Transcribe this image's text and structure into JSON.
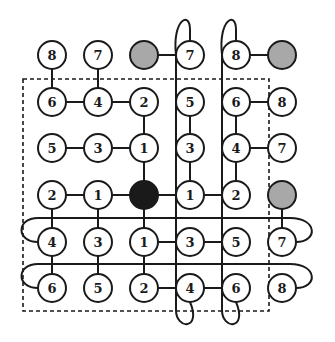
{
  "diagram": {
    "title": "",
    "grid": {
      "cols": 6,
      "rows": 6,
      "col_x": [
        52,
        98,
        144,
        190,
        236,
        282
      ],
      "row_y": [
        55,
        102,
        148,
        195,
        242,
        288
      ],
      "node_radius": 14
    },
    "colors": {
      "stroke": "#1a1a1a",
      "node_fill": "#ffffff",
      "gray_fill": "#a8a8a8",
      "black_fill": "#1a1a1a",
      "background": "#ffffff"
    },
    "nodes": [
      {
        "r": 0,
        "c": 0,
        "label": "8",
        "type": "normal"
      },
      {
        "r": 0,
        "c": 1,
        "label": "7",
        "type": "normal"
      },
      {
        "r": 0,
        "c": 2,
        "label": "",
        "type": "gray"
      },
      {
        "r": 0,
        "c": 3,
        "label": "7",
        "type": "normal"
      },
      {
        "r": 0,
        "c": 4,
        "label": "8",
        "type": "normal"
      },
      {
        "r": 0,
        "c": 5,
        "label": "",
        "type": "gray"
      },
      {
        "r": 1,
        "c": 0,
        "label": "6",
        "type": "normal"
      },
      {
        "r": 1,
        "c": 1,
        "label": "4",
        "type": "normal"
      },
      {
        "r": 1,
        "c": 2,
        "label": "2",
        "type": "normal"
      },
      {
        "r": 1,
        "c": 3,
        "label": "5",
        "type": "normal"
      },
      {
        "r": 1,
        "c": 4,
        "label": "6",
        "type": "normal"
      },
      {
        "r": 1,
        "c": 5,
        "label": "8",
        "type": "normal"
      },
      {
        "r": 2,
        "c": 0,
        "label": "5",
        "type": "normal"
      },
      {
        "r": 2,
        "c": 1,
        "label": "3",
        "type": "normal"
      },
      {
        "r": 2,
        "c": 2,
        "label": "1",
        "type": "normal"
      },
      {
        "r": 2,
        "c": 3,
        "label": "3",
        "type": "normal"
      },
      {
        "r": 2,
        "c": 4,
        "label": "4",
        "type": "normal"
      },
      {
        "r": 2,
        "c": 5,
        "label": "7",
        "type": "normal"
      },
      {
        "r": 3,
        "c": 0,
        "label": "2",
        "type": "normal"
      },
      {
        "r": 3,
        "c": 1,
        "label": "1",
        "type": "normal"
      },
      {
        "r": 3,
        "c": 2,
        "label": "",
        "type": "black"
      },
      {
        "r": 3,
        "c": 3,
        "label": "1",
        "type": "normal"
      },
      {
        "r": 3,
        "c": 4,
        "label": "2",
        "type": "normal"
      },
      {
        "r": 3,
        "c": 5,
        "label": "",
        "type": "gray"
      },
      {
        "r": 4,
        "c": 0,
        "label": "4",
        "type": "normal"
      },
      {
        "r": 4,
        "c": 1,
        "label": "3",
        "type": "normal"
      },
      {
        "r": 4,
        "c": 2,
        "label": "1",
        "type": "normal"
      },
      {
        "r": 4,
        "c": 3,
        "label": "3",
        "type": "normal"
      },
      {
        "r": 4,
        "c": 4,
        "label": "5",
        "type": "normal"
      },
      {
        "r": 4,
        "c": 5,
        "label": "7",
        "type": "normal"
      },
      {
        "r": 5,
        "c": 0,
        "label": "6",
        "type": "normal"
      },
      {
        "r": 5,
        "c": 1,
        "label": "5",
        "type": "normal"
      },
      {
        "r": 5,
        "c": 2,
        "label": "2",
        "type": "normal"
      },
      {
        "r": 5,
        "c": 3,
        "label": "4",
        "type": "normal"
      },
      {
        "r": 5,
        "c": 4,
        "label": "6",
        "type": "normal"
      },
      {
        "r": 5,
        "c": 5,
        "label": "8",
        "type": "normal"
      }
    ],
    "edges": [
      [
        [
          0,
          0
        ],
        [
          1,
          0
        ]
      ],
      [
        [
          0,
          1
        ],
        [
          1,
          1
        ]
      ],
      [
        [
          0,
          2
        ],
        [
          0,
          3
        ]
      ],
      [
        [
          0,
          4
        ],
        [
          0,
          5
        ]
      ],
      [
        [
          1,
          0
        ],
        [
          1,
          1
        ]
      ],
      [
        [
          1,
          1
        ],
        [
          1,
          2
        ]
      ],
      [
        [
          1,
          4
        ],
        [
          1,
          5
        ]
      ],
      [
        [
          1,
          2
        ],
        [
          2,
          2
        ]
      ],
      [
        [
          1,
          3
        ],
        [
          2,
          3
        ]
      ],
      [
        [
          1,
          4
        ],
        [
          2,
          4
        ]
      ],
      [
        [
          2,
          0
        ],
        [
          2,
          1
        ]
      ],
      [
        [
          2,
          1
        ],
        [
          2,
          2
        ]
      ],
      [
        [
          2,
          4
        ],
        [
          2,
          5
        ]
      ],
      [
        [
          2,
          2
        ],
        [
          3,
          2
        ]
      ],
      [
        [
          2,
          3
        ],
        [
          3,
          3
        ]
      ],
      [
        [
          2,
          4
        ],
        [
          3,
          4
        ]
      ],
      [
        [
          3,
          0
        ],
        [
          3,
          1
        ]
      ],
      [
        [
          3,
          1
        ],
        [
          3,
          2
        ]
      ],
      [
        [
          3,
          2
        ],
        [
          3,
          3
        ]
      ],
      [
        [
          3,
          3
        ],
        [
          3,
          4
        ]
      ],
      [
        [
          3,
          0
        ],
        [
          4,
          0
        ]
      ],
      [
        [
          3,
          1
        ],
        [
          4,
          1
        ]
      ],
      [
        [
          3,
          2
        ],
        [
          4,
          2
        ]
      ],
      [
        [
          3,
          5
        ],
        [
          4,
          5
        ]
      ],
      [
        [
          4,
          2
        ],
        [
          4,
          3
        ]
      ],
      [
        [
          4,
          3
        ],
        [
          4,
          4
        ]
      ],
      [
        [
          4,
          0
        ],
        [
          5,
          0
        ]
      ],
      [
        [
          4,
          1
        ],
        [
          5,
          1
        ]
      ],
      [
        [
          4,
          2
        ],
        [
          5,
          2
        ]
      ],
      [
        [
          5,
          2
        ],
        [
          5,
          3
        ]
      ],
      [
        [
          5,
          3
        ],
        [
          5,
          4
        ]
      ]
    ],
    "dashed_box": {
      "x": 23,
      "y": 79,
      "w": 246,
      "h": 232
    },
    "curves": [
      {
        "name": "vertical-loop-col3",
        "d": "M 176 55 C 172 20, 190 10, 190 30 L 190 41 M 176 55 L 176 310 C 176 330, 202 330, 190 302"
      },
      {
        "name": "vertical-loop-col4",
        "d": "M 222 55 C 218 20, 236 10, 236 30 L 236 41 M 222 55 L 222 310 C 222 330, 248 330, 236 302"
      },
      {
        "name": "horizontal-loop-row4",
        "d": "M 38 242 C 16 242, 16 218, 38 218 L 290 218 C 318 218, 318 242, 296 242"
      },
      {
        "name": "horizontal-loop-row5",
        "d": "M 38 288 C 16 288, 16 264, 38 264 L 290 264 C 318 264, 318 288, 296 288"
      }
    ]
  }
}
